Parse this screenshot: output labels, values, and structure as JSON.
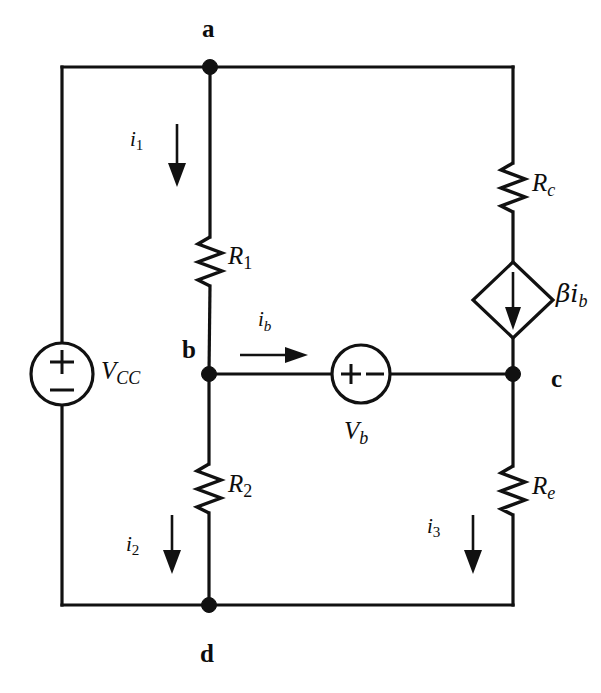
{
  "figure": {
    "type": "circuit-diagram",
    "background_color": "#ffffff",
    "ink_color": "#111111",
    "width": 601,
    "height": 693
  },
  "nodes": [
    {
      "id": "a",
      "label": "a",
      "x": 210,
      "y": 67,
      "label_x": 202,
      "label_y": 16,
      "dot": true
    },
    {
      "id": "b",
      "label": "b",
      "x": 209,
      "y": 374,
      "label_x": 182,
      "label_y": 337,
      "dot": true
    },
    {
      "id": "c",
      "label": "c",
      "x": 513,
      "y": 374,
      "label_x": 551,
      "label_y": 366,
      "dot": true
    },
    {
      "id": "d",
      "label": "d",
      "x": 209,
      "y": 605,
      "label_x": 200,
      "label_y": 641,
      "dot": true
    }
  ],
  "sources": [
    {
      "id": "vcc",
      "name": "voltage-source-vcc",
      "label_main": "V",
      "label_sub": "CC",
      "kind": "independent-dc",
      "orientation": "vertical",
      "plus_on": "top",
      "cx": 62,
      "cy": 374,
      "r": 31,
      "label_x": 101,
      "label_y": 358
    },
    {
      "id": "vb",
      "name": "voltage-source-vb",
      "label_main": "V",
      "label_sub": "b",
      "kind": "independent-dc",
      "orientation": "horizontal",
      "plus_on": "left",
      "cx": 361,
      "cy": 374,
      "r": 29,
      "label_x": 344,
      "label_y": 418
    },
    {
      "id": "beta_ib",
      "name": "dependent-current-source",
      "label_main": "βi",
      "label_sub": "b",
      "kind": "dependent-current",
      "orientation": "vertical-down",
      "cx": 513,
      "cy": 300,
      "rx": 40,
      "ry": 38,
      "label_x": 556,
      "label_y": 281
    }
  ],
  "resistors": [
    {
      "id": "R1",
      "name": "resistor-r1",
      "label_main": "R",
      "label_sub": "1",
      "orientation": "vertical",
      "x": 210,
      "y_top": 237,
      "y_bottom": 286,
      "label_x": 228,
      "label_y": 243
    },
    {
      "id": "R2",
      "name": "resistor-r2",
      "label_main": "R",
      "label_sub": "2",
      "orientation": "vertical",
      "x": 209,
      "y_top": 464,
      "y_bottom": 513,
      "label_x": 228,
      "label_y": 471
    },
    {
      "id": "Rc",
      "name": "resistor-rc",
      "label_main": "R",
      "label_sub": "c",
      "orientation": "vertical",
      "x": 513,
      "y_top": 163,
      "y_bottom": 212,
      "label_x": 532,
      "label_y": 170
    },
    {
      "id": "Re",
      "name": "resistor-re",
      "label_main": "R",
      "label_sub": "e",
      "orientation": "vertical",
      "x": 513,
      "y_top": 466,
      "y_bottom": 515,
      "label_x": 532,
      "label_y": 473
    }
  ],
  "currents": [
    {
      "id": "i1",
      "name": "current-arrow-i1",
      "label_main": "i",
      "label_sub": "1",
      "direction": "down",
      "x": 177,
      "y_start": 124,
      "y_end": 185,
      "label_x": 130,
      "label_y": 129
    },
    {
      "id": "ib",
      "name": "current-arrow-ib",
      "label_main": "i",
      "label_sub": "b",
      "direction": "right",
      "y": 355,
      "x_start": 240,
      "x_end": 307,
      "label_x": 258,
      "label_y": 309
    },
    {
      "id": "i2",
      "name": "current-arrow-i2",
      "label_main": "i",
      "label_sub": "2",
      "direction": "down",
      "x": 172,
      "y_start": 515,
      "y_end": 572,
      "label_x": 126,
      "label_y": 534
    },
    {
      "id": "i3",
      "name": "current-arrow-i3",
      "label_main": "i",
      "label_sub": "3",
      "direction": "down",
      "x": 473,
      "y_start": 515,
      "y_end": 572,
      "label_x": 427,
      "label_y": 516
    }
  ],
  "wires": [
    {
      "id": "top-left",
      "name": "wire-a-to-vcc-top",
      "points": "62,67 210,67"
    },
    {
      "id": "top-right",
      "name": "wire-a-to-rc-top",
      "points": "210,67 513,67"
    },
    {
      "id": "left-upper",
      "name": "wire-vcc-upper-lead",
      "points": "62,67 62,343"
    },
    {
      "id": "left-lower",
      "name": "wire-vcc-lower-lead",
      "points": "62,405 62,605"
    },
    {
      "id": "bottom-left",
      "name": "wire-d-to-left",
      "points": "62,605 209,605"
    },
    {
      "id": "bottom-right",
      "name": "wire-d-to-right",
      "points": "209,605 513,605"
    },
    {
      "id": "branch-a-r1",
      "name": "wire-a-to-r1",
      "points": "210,67 210,237"
    },
    {
      "id": "branch-r1-b",
      "name": "wire-r1-to-b",
      "points": "210,286 209,374"
    },
    {
      "id": "branch-b-r2",
      "name": "wire-b-to-r2",
      "points": "209,374 209,464"
    },
    {
      "id": "branch-r2-d",
      "name": "wire-r2-to-d",
      "points": "209,513 209,605"
    },
    {
      "id": "mid-b-vb",
      "name": "wire-b-to-vb",
      "points": "209,374 332,374"
    },
    {
      "id": "mid-vb-c",
      "name": "wire-vb-to-c",
      "points": "390,374 513,374"
    },
    {
      "id": "branch-top-rc",
      "name": "wire-top-to-rc",
      "points": "513,67 513,163"
    },
    {
      "id": "branch-rc-dep",
      "name": "wire-rc-to-source",
      "points": "513,212 513,262"
    },
    {
      "id": "branch-dep-c",
      "name": "wire-source-to-c",
      "points": "513,338 513,374"
    },
    {
      "id": "branch-c-re",
      "name": "wire-c-to-re",
      "points": "513,374 513,466"
    },
    {
      "id": "branch-re-d",
      "name": "wire-re-to-bottom",
      "points": "513,515 513,605"
    }
  ]
}
